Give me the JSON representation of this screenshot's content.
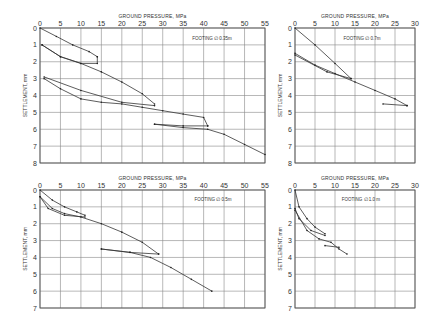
{
  "chart_data": [
    {
      "type": "line",
      "panel": "top-left",
      "title": "",
      "xlabel": "GROUND PRESSURE, MPa",
      "ylabel": "SETTLEMENT, mm",
      "annotation": "FOOTING ∅ 0.35m",
      "xlim": [
        0,
        55
      ],
      "ylim": [
        8,
        0
      ],
      "xticks": [
        0,
        5,
        10,
        15,
        20,
        25,
        30,
        35,
        40,
        45,
        50,
        55
      ],
      "yticks": [
        0,
        1,
        2,
        3,
        4,
        5,
        6,
        7,
        8
      ],
      "grid": true,
      "series": [
        {
          "name": "cycle 1 loading",
          "x": [
            0,
            4,
            8,
            12,
            14
          ],
          "y": [
            0,
            0.5,
            1.0,
            1.4,
            1.7
          ]
        },
        {
          "name": "cycle 1 unloading",
          "x": [
            14,
            14,
            10,
            5,
            0.5
          ],
          "y": [
            1.7,
            2.1,
            2.1,
            1.7,
            1.0
          ]
        },
        {
          "name": "cycle 1 reload",
          "x": [
            0.5,
            5,
            10,
            15,
            20,
            25,
            28
          ],
          "y": [
            1.0,
            1.7,
            2.1,
            2.6,
            3.2,
            3.9,
            4.5
          ]
        },
        {
          "name": "cycle 2 unloading",
          "x": [
            28,
            20,
            10,
            1
          ],
          "y": [
            4.6,
            4.4,
            3.7,
            2.9
          ]
        },
        {
          "name": "cycle 2 reload",
          "x": [
            1,
            5,
            10,
            15,
            20,
            25,
            30,
            35,
            40,
            41
          ],
          "y": [
            3.0,
            3.6,
            4.2,
            4.4,
            4.5,
            4.7,
            4.9,
            5.1,
            5.3,
            5.8
          ]
        },
        {
          "name": "cycle 3 unloading",
          "x": [
            41,
            35,
            28
          ],
          "y": [
            5.8,
            5.8,
            5.7
          ]
        },
        {
          "name": "cycle 3 reload",
          "x": [
            28,
            35,
            41,
            45,
            50,
            55
          ],
          "y": [
            5.7,
            5.9,
            6.0,
            6.3,
            6.9,
            7.5
          ]
        }
      ]
    },
    {
      "type": "line",
      "panel": "top-right",
      "xlabel": "GROUND PRESSURE, MPa",
      "ylabel": "SETTLEMENT, mm",
      "annotation": "FOOTING ∅ 0.7m",
      "xlim": [
        0,
        30
      ],
      "ylim": [
        8,
        0
      ],
      "xticks": [
        0,
        5,
        10,
        15,
        20,
        25,
        30
      ],
      "yticks": [
        0,
        1,
        2,
        3,
        4,
        5,
        6,
        7,
        8
      ],
      "grid": true,
      "series": [
        {
          "name": "cycle 1 loading",
          "x": [
            0,
            5,
            10,
            14
          ],
          "y": [
            0,
            1.0,
            2.1,
            3.0
          ]
        },
        {
          "name": "cycle 1 unloading",
          "x": [
            14,
            8,
            0
          ],
          "y": [
            3.0,
            2.6,
            1.6
          ]
        },
        {
          "name": "cycle 1 reload",
          "x": [
            0,
            5,
            10,
            15,
            20,
            25,
            28
          ],
          "y": [
            1.5,
            2.2,
            2.7,
            3.2,
            3.7,
            4.2,
            4.6
          ]
        },
        {
          "name": "cycle 2 unloading",
          "x": [
            28,
            22
          ],
          "y": [
            4.6,
            4.5
          ]
        }
      ]
    },
    {
      "type": "line",
      "panel": "bottom-left",
      "xlabel": "GROUND PRESSURE, MPa",
      "ylabel": "SETTLEMENT, mm",
      "annotation": "FOOTING ∅ 0.5m",
      "xlim": [
        0,
        55
      ],
      "ylim": [
        7,
        0
      ],
      "xticks": [
        0,
        5,
        10,
        15,
        20,
        25,
        30,
        35,
        40,
        45,
        50,
        55
      ],
      "yticks": [
        0,
        1,
        2,
        3,
        4,
        5,
        6,
        7
      ],
      "grid": true,
      "series": [
        {
          "name": "cycle 1 loading",
          "x": [
            0,
            3,
            6,
            9,
            11
          ],
          "y": [
            0,
            0.6,
            1.0,
            1.3,
            1.5
          ]
        },
        {
          "name": "cycle 1 unloading",
          "x": [
            11,
            6,
            2,
            0
          ],
          "y": [
            1.6,
            1.5,
            1.1,
            0.4
          ]
        },
        {
          "name": "cycle 1 reload",
          "x": [
            0,
            3,
            6,
            10,
            15,
            20,
            25,
            29
          ],
          "y": [
            0.4,
            1.1,
            1.4,
            1.6,
            2.0,
            2.5,
            3.1,
            3.8
          ]
        },
        {
          "name": "cycle 2 unloading",
          "x": [
            29,
            22,
            15
          ],
          "y": [
            3.8,
            3.7,
            3.5
          ]
        },
        {
          "name": "cycle 2 reload",
          "x": [
            15,
            22,
            27,
            32,
            37,
            42
          ],
          "y": [
            3.5,
            3.7,
            4.0,
            4.6,
            5.3,
            6.0
          ]
        }
      ]
    },
    {
      "type": "line",
      "panel": "bottom-right",
      "xlabel": "GROUND PRESSURE, MPa",
      "ylabel": "SETTLEMENT, mm",
      "annotation": "FOOTING ∅ 1.0 m",
      "xlim": [
        0,
        30
      ],
      "ylim": [
        7,
        0
      ],
      "xticks": [
        0,
        5,
        10,
        15,
        20,
        25,
        30
      ],
      "yticks": [
        0,
        1,
        2,
        3,
        4,
        5,
        6,
        7
      ],
      "grid": true,
      "series": [
        {
          "name": "cycle 1 loading",
          "x": [
            0,
            1,
            3,
            5,
            7.5
          ],
          "y": [
            0,
            1.0,
            1.7,
            2.2,
            2.6
          ]
        },
        {
          "name": "cycle 1 unloading",
          "x": [
            7.5,
            4,
            1,
            0
          ],
          "y": [
            2.7,
            2.4,
            1.7,
            1.1
          ]
        },
        {
          "name": "cycle 1 reload",
          "x": [
            0,
            3,
            6,
            9,
            11,
            13
          ],
          "y": [
            1.2,
            2.4,
            2.9,
            3.1,
            3.5,
            3.8
          ]
        },
        {
          "name": "cycle 2 unloading",
          "x": [
            11,
            7.5
          ],
          "y": [
            3.4,
            3.3
          ]
        }
      ]
    }
  ]
}
